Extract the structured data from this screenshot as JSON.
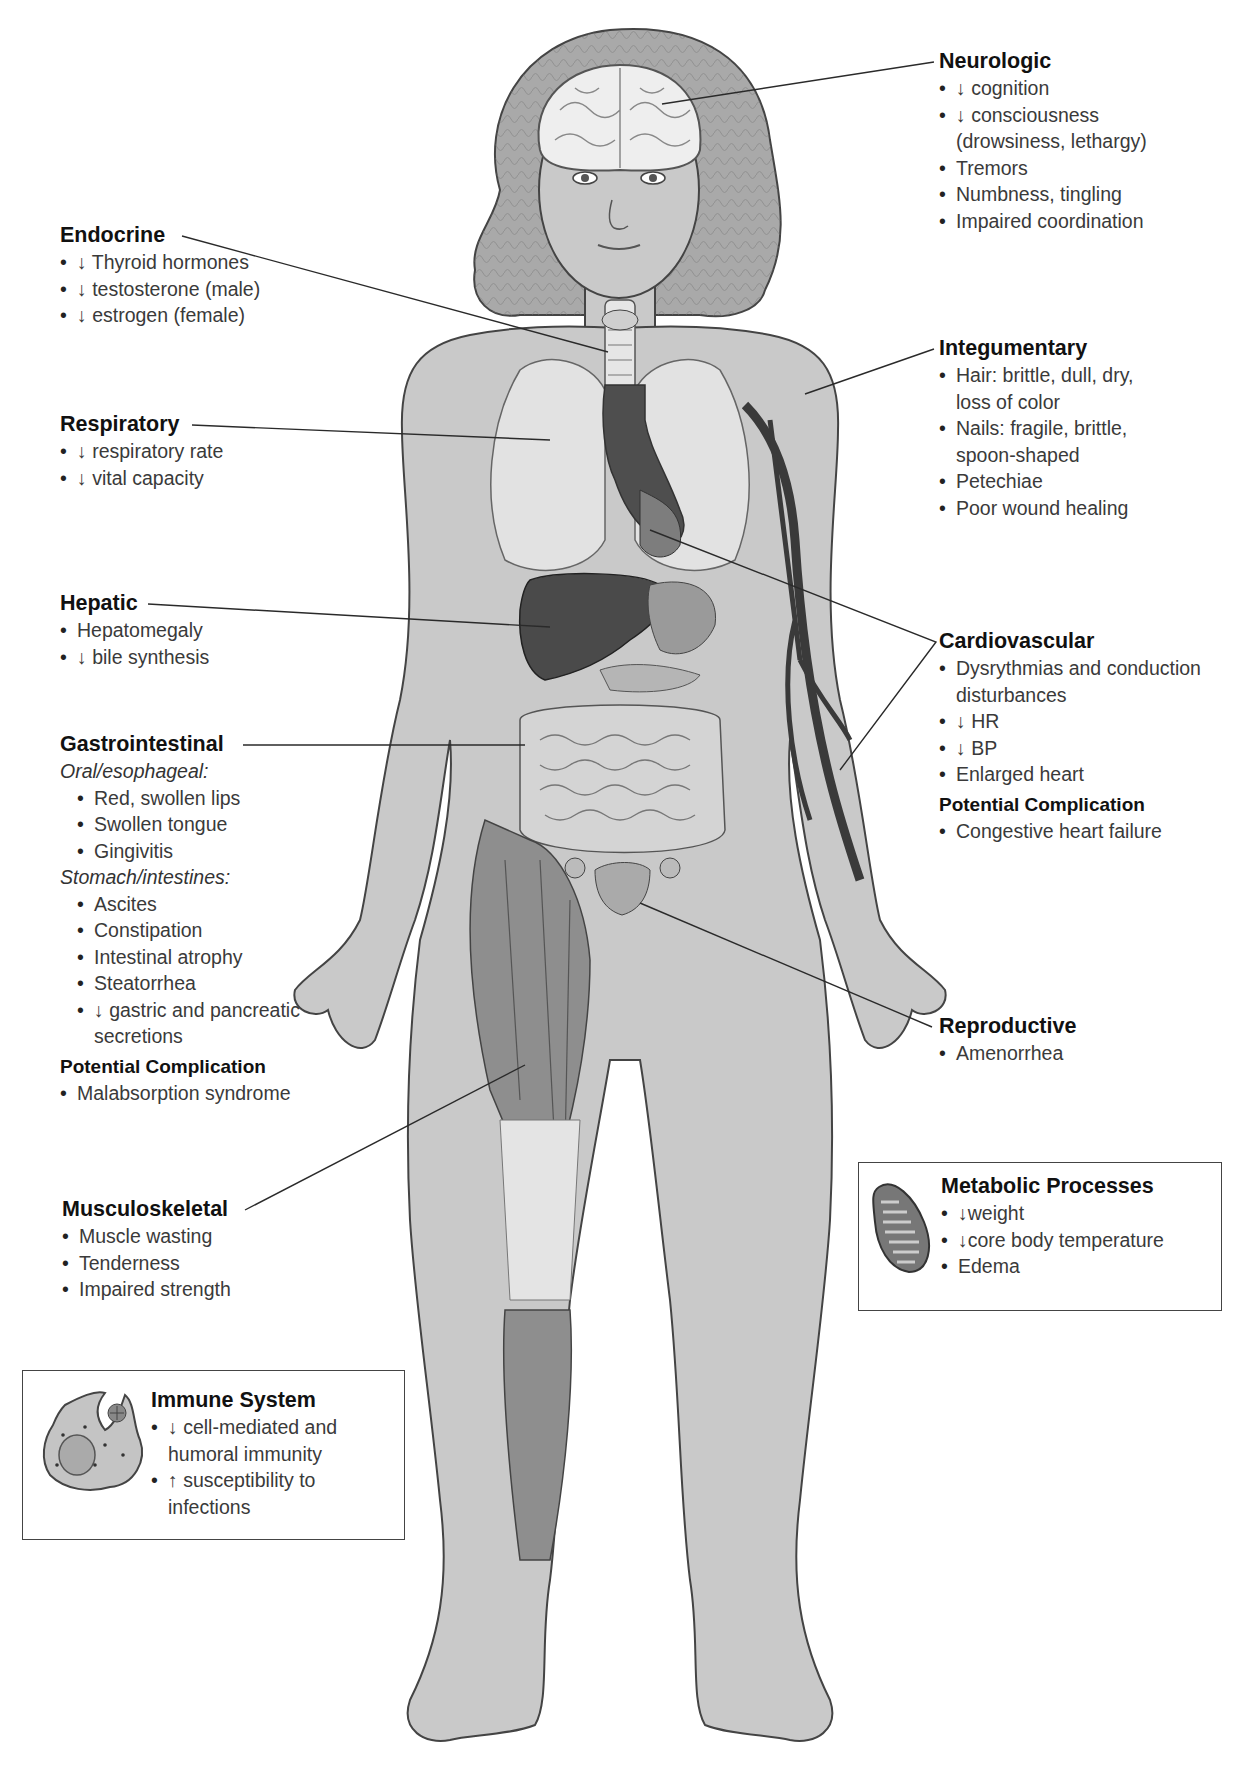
{
  "figure": {
    "colors": {
      "skin": "#c9c9c9",
      "organ_dark": "#4a4a4a",
      "organ_mid": "#8a8a8a",
      "lung": "#dedede",
      "muscle": "#8f8f8f",
      "line": "#2a2a2a"
    }
  },
  "neurologic": {
    "title": "Neurologic",
    "items": [
      "↓ cognition",
      "↓ consciousness (drowsiness, lethargy)",
      "Tremors",
      "Numbness, tingling",
      "Impaired coordination"
    ]
  },
  "endocrine": {
    "title": "Endocrine",
    "items": [
      "↓ Thyroid hormones",
      "↓ testosterone (male)",
      "↓ estrogen (female)"
    ]
  },
  "integumentary": {
    "title": "Integumentary",
    "items": [
      "Hair: brittle, dull, dry, loss of color",
      "Nails: fragile, brittle, spoon-shaped",
      "Petechiae",
      "Poor wound healing"
    ]
  },
  "respiratory": {
    "title": "Respiratory",
    "items": [
      "↓ respiratory rate",
      "↓ vital capacity"
    ]
  },
  "hepatic": {
    "title": "Hepatic",
    "items": [
      "Hepatomegaly",
      "↓ bile synthesis"
    ]
  },
  "cardiovascular": {
    "title": "Cardiovascular",
    "items": [
      "Dysrythmias and conduction disturbances",
      "↓ HR",
      "↓ BP",
      "Enlarged heart"
    ],
    "complication_title": "Potential Complication",
    "complications": [
      "Congestive heart failure"
    ]
  },
  "gastrointestinal": {
    "title": "Gastrointestinal",
    "oral_heading": "Oral/esophageal:",
    "oral_items": [
      "Red, swollen lips",
      "Swollen tongue",
      "Gingivitis"
    ],
    "stomach_heading": "Stomach/intestines:",
    "stomach_items": [
      "Ascites",
      "Constipation",
      "Intestinal atrophy",
      "Steatorrhea",
      "↓ gastric and pancreatic secretions"
    ],
    "complication_title": "Potential Complication",
    "complications": [
      "Malabsorption syndrome"
    ]
  },
  "reproductive": {
    "title": "Reproductive",
    "items": [
      "Amenorrhea"
    ]
  },
  "metabolic": {
    "title": "Metabolic Processes",
    "icon": "mitochondrion-icon",
    "items": [
      "↓weight",
      "↓core body temperature",
      "Edema"
    ]
  },
  "musculoskeletal": {
    "title": "Musculoskeletal",
    "items": [
      "Muscle wasting",
      "Tenderness",
      "Impaired strength"
    ]
  },
  "immune": {
    "title": "Immune System",
    "icon": "macrophage-icon",
    "items": [
      "↓ cell-mediated and humoral immunity",
      "↑ susceptibility to infections"
    ]
  }
}
